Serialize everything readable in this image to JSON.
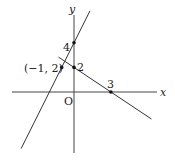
{
  "diagram": {
    "type": "coordinate-plane",
    "axes": {
      "x_label": "x",
      "y_label": "y",
      "origin_label": "O"
    },
    "lines": [
      {
        "name": "line-a",
        "equation": "y = 2x + 4",
        "through": [
          [
            0,
            4
          ],
          [
            -1,
            2
          ]
        ]
      },
      {
        "name": "line-b",
        "equation": "y = -2/3 x + 2",
        "through": [
          [
            0,
            2
          ],
          [
            3,
            0
          ]
        ]
      }
    ],
    "points": [
      {
        "name": "y-intercept-4",
        "coords": [
          0,
          4
        ],
        "label": "4"
      },
      {
        "name": "y-intercept-2",
        "coords": [
          0,
          2
        ],
        "label": "2"
      },
      {
        "name": "x-intercept-3",
        "coords": [
          3,
          0
        ],
        "label": "3"
      },
      {
        "name": "point-neg1-2",
        "coords": [
          -1,
          2
        ],
        "label": "(−1, 2)"
      }
    ]
  }
}
